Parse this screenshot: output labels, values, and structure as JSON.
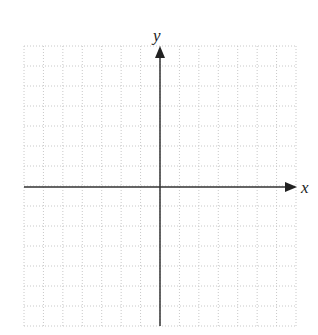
{
  "diagram": {
    "type": "coordinate-grid",
    "x_axis_label": "x",
    "y_axis_label": "y",
    "grid": {
      "columns": 14,
      "rows": 14,
      "style": "dotted",
      "color": "#c8c8c8"
    },
    "axis_color": "#333333",
    "origin_marked": false
  },
  "chart_data": {
    "type": "scatter",
    "title": "",
    "xlabel": "x",
    "ylabel": "y",
    "x": [],
    "y": [],
    "grid": true,
    "tick_labels": "none"
  }
}
